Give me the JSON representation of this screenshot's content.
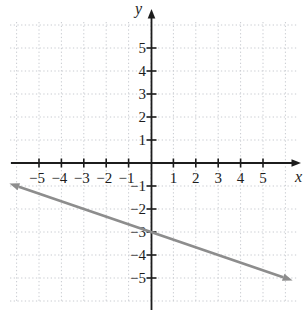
{
  "figure": {
    "background": "#ffffff"
  },
  "chart_data": {
    "type": "line",
    "xlabel": "x",
    "ylabel": "y",
    "xlim": [
      -6.5,
      6.6
    ],
    "ylim": [
      -6.6,
      6.5
    ],
    "axis_color": "#1c1c1c",
    "grid": {
      "visible": true,
      "style": "dotted",
      "color": "#c8cbd0",
      "min": -6,
      "max": 6,
      "step": 1
    },
    "x_ticks": [
      -5,
      -4,
      -3,
      -2,
      -1,
      1,
      2,
      3,
      4,
      5
    ],
    "y_ticks": [
      -5,
      -4,
      -3,
      -2,
      -1,
      1,
      2,
      3,
      4,
      5
    ],
    "x_tick_labels": [
      "−5",
      "−4",
      "−3",
      "−2",
      "−1",
      "1",
      "2",
      "3",
      "4",
      "5"
    ],
    "y_tick_labels": [
      "−5",
      "−4",
      "−3",
      "−2",
      "−1",
      "1",
      "2",
      "3",
      "4",
      "5"
    ],
    "series": [
      {
        "name": "plotted-line",
        "equation": "y = -(1/3)x - 3",
        "slope": -0.3333,
        "y_intercept": -3,
        "x_start": -5.9,
        "x_end": 5.9,
        "color": "#8d8d8d",
        "width": 2.7,
        "arrow_both_ends": true,
        "passes_through": [
          {
            "x": -6,
            "y": -1
          },
          {
            "x": -3,
            "y": -2
          },
          {
            "x": 0,
            "y": -3
          },
          {
            "x": 3,
            "y": -4
          },
          {
            "x": 6,
            "y": -5
          }
        ]
      }
    ]
  }
}
